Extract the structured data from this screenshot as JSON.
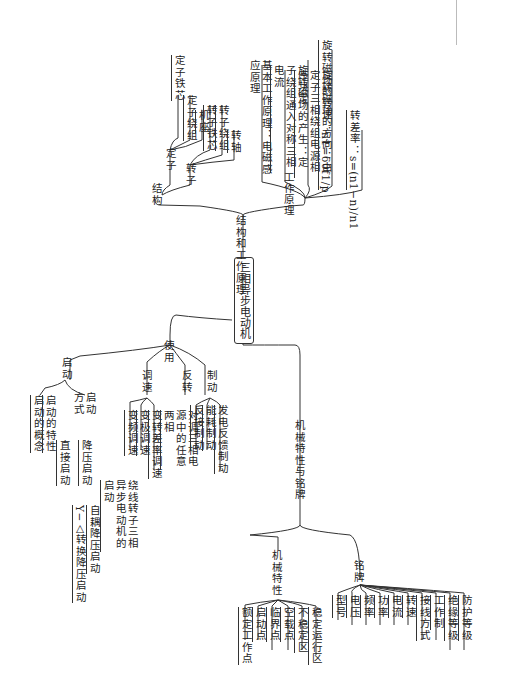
{
  "root": "三相异步电动机",
  "branches": {
    "structure_principle": {
      "label": "结构和工作原理",
      "structure": {
        "label": "结构",
        "stator": {
          "label": "定子",
          "items": [
            "定子铁芯",
            "定子绕组",
            "机座"
          ]
        },
        "rotor": {
          "label": "转子",
          "items": [
            "转子铁芯",
            "转子绕组",
            "转轴"
          ]
        }
      },
      "principle": {
        "label": "工作原理",
        "items": [
          "基本工作原理：电磁感应原理",
          "旋转磁场的产生：定子绕组通入对称三相电流",
          "旋转磁场的方向：由定子三相绕组电源相序决定",
          "旋转磁场的转速：n1=60f1/p",
          "转差率：s=(n1−n)/n1"
        ],
        "speed_formula": "n₁=60f₁/p",
        "slip_formula": "s=(n₁−n)/n₁"
      }
    },
    "usage": {
      "label": "使用",
      "start": {
        "label": "启动",
        "items": [
          "启动的概念",
          "启动的特性"
        ],
        "methods": {
          "label": "启动方式",
          "direct": "直接启动",
          "reduced": {
            "label": "降压启动",
            "items": [
              "Y−△转换降压启动",
              "自耦降压启动"
            ]
          },
          "wound": "绕线转子三相异步电动机的启动"
        }
      },
      "speed": {
        "label": "调速",
        "items": [
          "变频调速",
          "变极调速",
          "变转差率调速"
        ]
      },
      "reverse": {
        "label": "反转",
        "items": [
          "对调三相电源中的任意两相"
        ]
      },
      "brake": {
        "label": "制动",
        "items": [
          "反接制动",
          "能耗制动",
          "发电反馈制动"
        ]
      }
    },
    "mech_nameplate": {
      "label": "机械特性与铭牌",
      "mech": {
        "label": "机械特性",
        "items": [
          "额定工作点",
          "启动点",
          "临界点",
          "空载点",
          "不稳定区",
          "稳定运行区"
        ]
      },
      "nameplate": {
        "label": "铭牌",
        "items": [
          "型号",
          "电压",
          "频率",
          "功率",
          "电流",
          "转速",
          "接线方式",
          "工作制",
          "绝缘等级",
          "防护等级"
        ]
      }
    }
  }
}
